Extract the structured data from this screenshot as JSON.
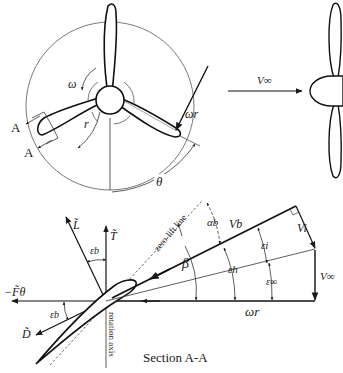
{
  "front_view": {
    "omega": "ω",
    "radius": "r",
    "omega_r": "ωr",
    "theta": "θ",
    "section_mark_top": "A",
    "section_mark_bottom": "A"
  },
  "side_view": {
    "freestream_velocity": "V∞"
  },
  "section": {
    "lift": "L̃",
    "thrust": "T̃",
    "tangential_force": "−F̃θ",
    "drag": "D̃",
    "eps_b_lift": "εb",
    "eps_b_drag": "εb",
    "zero_lift_line": "zero-lift line",
    "rotation_axis": "rotation axis",
    "alpha_b": "αb",
    "beta": "β",
    "v_b": "Vb",
    "v_i": "Vi",
    "eps_i": "εi",
    "eps_h": "εh",
    "eps_inf": "ε∞",
    "v_inf": "V∞",
    "omega_r": "ωr",
    "caption": "Section A-A"
  },
  "colors": {
    "stroke": "#1a1a1a",
    "thin": "#333333",
    "background": "#ffffff"
  }
}
